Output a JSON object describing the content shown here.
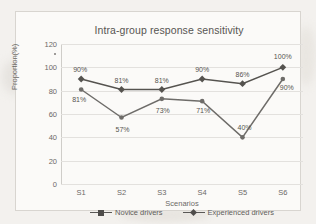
{
  "chart_data": {
    "type": "line",
    "title": "Intra-group response sensitivity",
    "xlabel": "Scenarios",
    "ylabel": "Proportion(%)",
    "categories": [
      "S1",
      "S2",
      "S3",
      "S4",
      "S5",
      "S6"
    ],
    "ylim": [
      0,
      120
    ],
    "yticks": [
      0,
      20,
      40,
      60,
      80,
      100,
      120
    ],
    "grid": true,
    "legend_position": "bottom",
    "series": [
      {
        "name": "Novice drivers",
        "values": [
          81,
          57,
          73,
          71,
          40,
          90
        ],
        "labels": [
          "81%",
          "57%",
          "73%",
          "71%",
          "40%",
          "90%"
        ],
        "color": "#6e6c69",
        "marker": "square"
      },
      {
        "name": "Experienced drivers",
        "values": [
          90,
          81,
          81,
          90,
          86,
          100
        ],
        "labels": [
          "90%",
          "81%",
          "81%",
          "90%",
          "86%",
          "100%"
        ],
        "color": "#55534f",
        "marker": "diamond"
      }
    ]
  },
  "colors": {
    "page_background": "#f3f1ee",
    "plot_background": "#fbfaf8",
    "grid": "#e3e1de",
    "text": "#6b6966",
    "series_novice": "#6e6c69",
    "series_experienced": "#55534f"
  }
}
